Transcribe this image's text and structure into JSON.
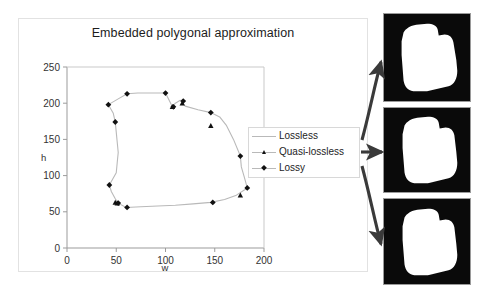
{
  "figure": {
    "title": "Embedded polygonal approximation",
    "panel_count": 3
  },
  "chart_data": {
    "type": "scatter",
    "title": "Embedded polygonal approximation",
    "xlabel": "w",
    "ylabel": "h",
    "xlim": [
      0,
      200
    ],
    "ylim": [
      0,
      250
    ],
    "xticks": [
      "0",
      "50",
      "100",
      "150",
      "200"
    ],
    "yticks": [
      "0",
      "50",
      "100",
      "150",
      "200",
      "250"
    ],
    "grid": false,
    "legend_position": "right",
    "series": [
      {
        "name": "Lossless",
        "marker": "none",
        "style": "line",
        "color": "#b9b9b9",
        "points": [
          [
            42,
            198
          ],
          [
            47,
            186
          ],
          [
            49,
            174
          ],
          [
            50,
            160
          ],
          [
            51,
            146
          ],
          [
            52,
            132
          ],
          [
            51,
            118
          ],
          [
            50,
            104
          ],
          [
            43,
            87
          ],
          [
            45,
            78
          ],
          [
            49,
            68
          ],
          [
            52,
            62
          ],
          [
            60,
            56
          ],
          [
            75,
            57
          ],
          [
            92,
            58
          ],
          [
            110,
            59
          ],
          [
            128,
            61
          ],
          [
            146,
            63
          ],
          [
            160,
            67
          ],
          [
            172,
            73
          ],
          [
            180,
            80
          ],
          [
            183,
            83
          ],
          [
            180,
            98
          ],
          [
            177,
            112
          ],
          [
            176,
            127
          ],
          [
            169,
            150
          ],
          [
            162,
            169
          ],
          [
            155,
            181
          ],
          [
            146,
            187
          ],
          [
            133,
            191
          ],
          [
            120,
            196
          ],
          [
            117,
            200
          ],
          [
            115,
            204
          ],
          [
            110,
            200
          ],
          [
            107,
            195
          ],
          [
            100,
            214
          ],
          [
            85,
            214
          ],
          [
            72,
            214
          ],
          [
            61,
            213
          ],
          [
            52,
            206
          ],
          [
            42,
            198
          ]
        ]
      },
      {
        "name": "Quasi-lossless",
        "marker": "triangle",
        "color": "#111111",
        "points": [
          [
            49,
            63
          ],
          [
            51,
            62
          ],
          [
            107,
            195
          ],
          [
            117,
            200
          ],
          [
            146,
            169
          ],
          [
            176,
            73
          ]
        ]
      },
      {
        "name": "Lossy",
        "marker": "diamond",
        "color": "#111111",
        "points": [
          [
            42,
            198
          ],
          [
            49,
            174
          ],
          [
            43,
            87
          ],
          [
            52,
            62
          ],
          [
            61,
            56
          ],
          [
            100,
            214
          ],
          [
            61,
            213
          ],
          [
            108,
            195
          ],
          [
            118,
            203
          ],
          [
            146,
            187
          ],
          [
            176,
            127
          ],
          [
            183,
            83
          ],
          [
            148,
            63
          ]
        ]
      }
    ]
  },
  "legend": {
    "items": [
      {
        "label": "Lossless",
        "marker": "line"
      },
      {
        "label": "Quasi-lossless",
        "marker": "triangle"
      },
      {
        "label": "Lossy",
        "marker": "diamond"
      }
    ]
  },
  "panels": [
    {
      "name": "lossless-shape-image",
      "caption": ""
    },
    {
      "name": "quasi-lossless-shape-image",
      "caption": ""
    },
    {
      "name": "lossy-shape-image",
      "caption": ""
    }
  ],
  "arrows": [
    {
      "name": "arrow-to-top-panel",
      "target": "lossless-shape-image"
    },
    {
      "name": "arrow-to-middle-panel",
      "target": "quasi-lossless-shape-image"
    },
    {
      "name": "arrow-to-bottom-panel",
      "target": "lossy-shape-image"
    }
  ],
  "colors": {
    "line": "#b9b9b9",
    "marker": "#111111",
    "axis": "#9b9b9b",
    "frame_border": "#e2e2e2",
    "image_bg": "#0a0a0a",
    "image_fg": "#ffffff",
    "arrow": "#3a3a3a"
  }
}
